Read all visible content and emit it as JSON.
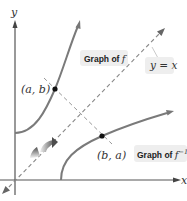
{
  "diagram": {
    "axes": {
      "x_label": "x",
      "y_label": "y"
    },
    "curves": [
      {
        "id": "f",
        "label": "Graph of ",
        "label_math": "f",
        "label_sup": "",
        "color": "#7a7a7a"
      },
      {
        "id": "f_inv",
        "label": "Graph of ",
        "label_math": "f",
        "label_sup": "−1",
        "color": "#7a7a7a"
      }
    ],
    "line": {
      "label": "y = x",
      "style": "dashed",
      "color": "#888888"
    },
    "points": [
      {
        "label": "(a, b)",
        "on": "f"
      },
      {
        "label": "(b, a)",
        "on": "f_inv"
      }
    ],
    "colors": {
      "axis": "#555555",
      "curve": "#7a7a7a",
      "dashed": "#888888",
      "label_bg": "#eeeeee",
      "point": "#111111",
      "arrow_dark": "#555555",
      "arrow_light": "#e6e6e6"
    },
    "icons": [
      "reflection-arrow-icon"
    ]
  }
}
